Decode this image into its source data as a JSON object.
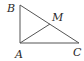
{
  "diagram": {
    "type": "geometry",
    "points": {
      "B": {
        "label": "B",
        "x": 20,
        "y": 5
      },
      "A": {
        "label": "A",
        "x": 20,
        "y": 43
      },
      "C": {
        "label": "C",
        "x": 79,
        "y": 43
      },
      "M": {
        "label": "M",
        "x": 50,
        "y": 24
      }
    },
    "segments": [
      [
        "A",
        "B"
      ],
      [
        "A",
        "C"
      ],
      [
        "B",
        "C"
      ],
      [
        "A",
        "M"
      ]
    ],
    "colors": {
      "line": "#555555",
      "label": "#2a2a2a"
    }
  }
}
